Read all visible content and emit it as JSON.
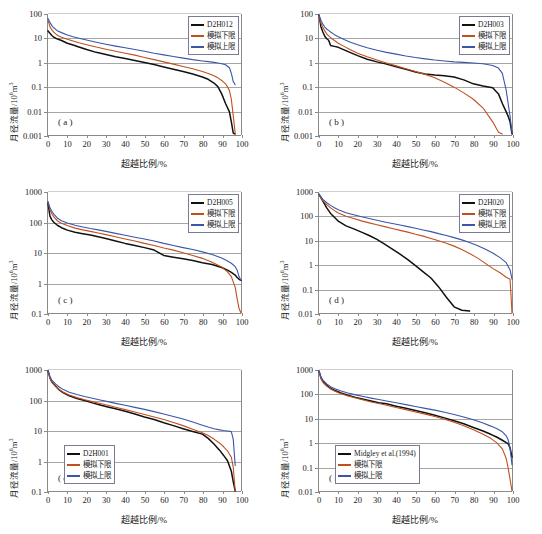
{
  "figure": {
    "axis_titles": {
      "y": "月径流量/10",
      "y_sup": "6",
      "y_tail": "m",
      "y_tail_sup": "3",
      "x": "超越比例/%"
    },
    "series_labels": {
      "lower": "模拟下限",
      "upper": "模拟上限"
    },
    "colors": {
      "observed": "#111111",
      "lower": "#c0501e",
      "upper": "#3a56a8",
      "grid": "#a6a6a6",
      "axis": "#8a8a8a"
    },
    "xticks": [
      "0",
      "10",
      "20",
      "30",
      "40",
      "50",
      "60",
      "70",
      "80",
      "90",
      "100"
    ]
  },
  "chart_data": [
    {
      "type": "line",
      "panel": "( a )",
      "title": "",
      "xlabel": "超越比例/%",
      "ylabel": "月径流量/10^6 m^3",
      "xlim": [
        0,
        100
      ],
      "ylim": [
        0.001,
        100
      ],
      "yscale": "log",
      "yticks": [
        "100",
        "10",
        "1",
        "0.1",
        "0.01",
        "0.001"
      ],
      "grid": true,
      "legend_position": "top-right",
      "legend": [
        "D2H012",
        "模拟下限",
        "模拟上限"
      ],
      "x": [
        0,
        1,
        2,
        3,
        4,
        5,
        7,
        10,
        13,
        16,
        20,
        25,
        30,
        35,
        40,
        45,
        50,
        55,
        60,
        65,
        70,
        75,
        80,
        83,
        86,
        88,
        90,
        92,
        94,
        95,
        96,
        97
      ],
      "series": [
        {
          "name": "D2H012",
          "color": "#111111",
          "values": [
            20,
            16,
            13,
            11,
            10,
            9.2,
            8,
            6.2,
            5.2,
            4.3,
            3.4,
            2.6,
            2.1,
            1.7,
            1.45,
            1.2,
            1.0,
            0.82,
            0.65,
            0.52,
            0.42,
            0.33,
            0.25,
            0.2,
            0.14,
            0.1,
            0.05,
            0.02,
            0.009,
            0.0035,
            0.0012,
            0.0011
          ]
        },
        {
          "name": "模拟下限",
          "color": "#c0501e",
          "values": [
            55,
            30,
            22,
            18,
            15,
            13,
            11,
            9.0,
            7.6,
            6.5,
            5.4,
            4.3,
            3.5,
            2.9,
            2.4,
            2.0,
            1.6,
            1.3,
            1.05,
            0.85,
            0.68,
            0.55,
            0.42,
            0.35,
            0.28,
            0.23,
            0.18,
            0.13,
            0.07,
            0.03,
            0.006,
            0.0012
          ]
        },
        {
          "name": "模拟上限",
          "color": "#3a56a8",
          "values": [
            65,
            45,
            33,
            27,
            23,
            20,
            17,
            13.5,
            11.5,
            10,
            8.4,
            6.8,
            5.6,
            4.7,
            4.0,
            3.4,
            2.9,
            2.4,
            2.05,
            1.75,
            1.5,
            1.3,
            1.15,
            1.08,
            1.0,
            0.95,
            0.88,
            0.8,
            0.6,
            0.35,
            0.16,
            0.12
          ]
        }
      ]
    },
    {
      "type": "line",
      "panel": "( b )",
      "xlabel": "超越比例/%",
      "ylabel": "月径流量/10^6 m^3",
      "xlim": [
        0,
        100
      ],
      "ylim": [
        0.001,
        100
      ],
      "yscale": "log",
      "yticks": [
        "100",
        "10",
        "1",
        "0.1",
        "0.01",
        "0.001"
      ],
      "grid": true,
      "legend_position": "top-right",
      "legend": [
        "D2H003",
        "模拟下限",
        "模拟上限"
      ],
      "x": [
        0,
        1,
        2,
        3,
        4,
        5,
        6,
        8,
        10,
        13,
        16,
        20,
        25,
        30,
        35,
        40,
        45,
        50,
        55,
        60,
        65,
        70,
        75,
        80,
        85,
        90,
        93,
        95,
        97,
        98,
        99,
        100
      ],
      "series": [
        {
          "name": "D2H003",
          "color": "#111111",
          "values": [
            90,
            30,
            18,
            12,
            9.5,
            8.2,
            5.0,
            4.6,
            4.2,
            3.3,
            2.6,
            1.9,
            1.35,
            1.05,
            0.85,
            0.66,
            0.52,
            0.4,
            0.33,
            0.3,
            0.28,
            0.25,
            0.19,
            0.13,
            0.105,
            0.09,
            0.05,
            0.02,
            0.009,
            0.006,
            0.0035,
            0.0011
          ]
        },
        {
          "name": "模拟下限",
          "color": "#c0501e",
          "values": [
            80,
            42,
            28,
            20,
            15,
            12.5,
            10.5,
            8.0,
            6.2,
            4.6,
            3.4,
            2.4,
            1.7,
            1.25,
            0.95,
            0.72,
            0.55,
            0.42,
            0.32,
            0.23,
            0.15,
            0.095,
            0.055,
            0.03,
            0.013,
            0.0035,
            0.0013,
            0.0011,
            null,
            null,
            null,
            null
          ]
        },
        {
          "name": "模拟上限",
          "color": "#3a56a8",
          "values": [
            92,
            55,
            38,
            29,
            24,
            21,
            18,
            14,
            11.5,
            8.8,
            7.0,
            5.4,
            4.0,
            3.2,
            2.6,
            2.2,
            1.85,
            1.6,
            1.4,
            1.25,
            1.15,
            1.05,
            1.0,
            0.95,
            0.88,
            0.75,
            0.58,
            0.35,
            0.07,
            0.02,
            0.006,
            0.0012
          ]
        }
      ]
    },
    {
      "type": "line",
      "panel": "( c )",
      "xlabel": "超越比例/%",
      "ylabel": "月径流量/10^6 m^3",
      "xlim": [
        0,
        100
      ],
      "ylim": [
        0.1,
        1000
      ],
      "yscale": "log",
      "yticks": [
        "1000",
        "100",
        "10",
        "1",
        "0.1"
      ],
      "grid": true,
      "legend_position": "top-right",
      "legend": [
        "D2H005",
        "模拟下限",
        "模拟上限"
      ],
      "x": [
        0,
        1,
        2,
        3,
        5,
        7,
        10,
        14,
        18,
        22,
        26,
        30,
        35,
        40,
        45,
        50,
        55,
        60,
        65,
        70,
        75,
        80,
        85,
        90,
        93,
        95,
        97,
        98,
        99,
        100
      ],
      "series": [
        {
          "name": "D2H005",
          "color": "#111111",
          "values": [
            430,
            160,
            120,
            100,
            78,
            66,
            55,
            47,
            42,
            38,
            33,
            29,
            24,
            20,
            17,
            14.5,
            12,
            8.0,
            7.0,
            6.2,
            5.4,
            4.6,
            4.0,
            3.2,
            2.6,
            2.2,
            1.8,
            1.5,
            1.3,
            1.2
          ]
        },
        {
          "name": "模拟下限",
          "color": "#c0501e",
          "values": [
            460,
            260,
            190,
            150,
            110,
            92,
            78,
            64,
            56,
            50,
            44,
            39,
            33,
            28,
            24,
            20,
            17,
            14,
            12,
            9.8,
            8.0,
            6.4,
            4.8,
            3.3,
            2.3,
            1.6,
            0.7,
            0.3,
            0.14,
            0.1
          ]
        },
        {
          "name": "模拟上限",
          "color": "#3a56a8",
          "values": [
            490,
            300,
            230,
            185,
            135,
            112,
            95,
            80,
            70,
            62,
            56,
            50,
            43,
            37,
            32,
            28,
            24,
            20,
            17,
            14.5,
            12.5,
            10.5,
            8.6,
            6.6,
            5.2,
            4.4,
            3.4,
            2.6,
            1.6,
            1.2
          ]
        }
      ]
    },
    {
      "type": "line",
      "panel": "( d )",
      "xlabel": "超越比例/%",
      "ylabel": "月径流量/10^6 m^3",
      "xlim": [
        0,
        100
      ],
      "ylim": [
        0.01,
        1000
      ],
      "yscale": "log",
      "yticks": [
        "1000",
        "100",
        "10",
        "1",
        "0.1",
        "0.01"
      ],
      "grid": true,
      "legend_position": "top-right",
      "legend": [
        "D2H020",
        "模拟下限",
        "模拟上限"
      ],
      "x": [
        0,
        2,
        4,
        6,
        8,
        10,
        14,
        18,
        22,
        26,
        30,
        34,
        38,
        42,
        46,
        50,
        54,
        58,
        62,
        66,
        70,
        74,
        78,
        82,
        86,
        90,
        94,
        97,
        99,
        100
      ],
      "series": [
        {
          "name": "D2H020",
          "color": "#111111",
          "values": [
            800,
            420,
            220,
            130,
            90,
            62,
            40,
            30,
            22,
            16,
            11,
            7.0,
            4.4,
            2.7,
            1.6,
            0.9,
            0.5,
            0.28,
            0.12,
            0.045,
            0.018,
            0.013,
            0.012,
            null,
            null,
            null,
            null,
            null,
            null,
            null
          ]
        },
        {
          "name": "模拟下限",
          "color": "#c0501e",
          "values": [
            780,
            440,
            300,
            220,
            170,
            135,
            100,
            80,
            64,
            53,
            44,
            37,
            31,
            26,
            22,
            18,
            15,
            12,
            9.6,
            7.6,
            5.8,
            4.2,
            2.9,
            1.9,
            1.15,
            0.7,
            0.45,
            0.3,
            0.25,
            0.01
          ]
        },
        {
          "name": "模拟上限",
          "color": "#3a56a8",
          "values": [
            820,
            500,
            360,
            280,
            225,
            185,
            140,
            115,
            95,
            80,
            68,
            58,
            50,
            43,
            37,
            32,
            27,
            23,
            19,
            16,
            13,
            10.5,
            8.2,
            6.2,
            4.4,
            3.0,
            1.9,
            1.2,
            0.6,
            0.25
          ]
        }
      ]
    },
    {
      "type": "line",
      "panel": "( e )",
      "xlabel": "超越比例/%",
      "ylabel": "月径流量/10^6 m^3",
      "xlim": [
        0,
        100
      ],
      "ylim": [
        0.1,
        1000
      ],
      "yscale": "log",
      "yticks": [
        "1000",
        "100",
        "10",
        "1",
        "0.1"
      ],
      "grid": true,
      "legend_position": "mid-left",
      "legend": [
        "D2H001",
        "模拟下限",
        "模拟上限"
      ],
      "x": [
        0,
        1,
        2,
        4,
        6,
        8,
        11,
        15,
        19,
        23,
        27,
        31,
        35,
        40,
        45,
        50,
        55,
        60,
        65,
        70,
        75,
        80,
        83,
        86,
        89,
        91,
        93,
        95,
        96,
        97
      ],
      "series": [
        {
          "name": "D2H001",
          "color": "#111111",
          "values": [
            950,
            560,
            400,
            290,
            215,
            175,
            140,
            115,
            98,
            82,
            70,
            60,
            52,
            43,
            35,
            28,
            23,
            18,
            14.5,
            11.5,
            9.2,
            7.6,
            5.5,
            3.6,
            2.2,
            1.5,
            1.0,
            0.45,
            0.2,
            0.1
          ]
        },
        {
          "name": "模拟下限",
          "color": "#c0501e",
          "values": [
            960,
            520,
            390,
            280,
            220,
            185,
            150,
            122,
            104,
            90,
            78,
            68,
            59,
            49,
            41,
            34,
            28,
            23,
            18.5,
            14.5,
            11.0,
            8.4,
            6.8,
            5.2,
            3.8,
            2.9,
            2.1,
            1.3,
            0.6,
            0.1
          ]
        },
        {
          "name": "模拟上限",
          "color": "#3a56a8",
          "values": [
            980,
            600,
            460,
            340,
            270,
            225,
            185,
            155,
            133,
            116,
            102,
            90,
            79,
            68,
            58,
            50,
            42,
            35,
            29,
            24,
            19,
            15,
            13,
            11.5,
            10.5,
            10.0,
            9.6,
            9.2,
            5.0,
            0.7
          ]
        }
      ]
    },
    {
      "type": "line",
      "panel": "( f )",
      "xlabel": "超越比例/%",
      "ylabel": "月径流量/10^6 m^3",
      "xlim": [
        0,
        100
      ],
      "ylim": [
        0.01,
        1000
      ],
      "yscale": "log",
      "yticks": [
        "1000",
        "100",
        "10",
        "1",
        "0.1",
        "0.01"
      ],
      "grid": true,
      "legend_position": "mid-left",
      "legend": [
        "Midgley et al.(1994)",
        "模拟下限",
        "模拟上限"
      ],
      "x": [
        0,
        1,
        2,
        4,
        6,
        8,
        11,
        15,
        19,
        23,
        27,
        31,
        35,
        40,
        45,
        50,
        55,
        60,
        65,
        70,
        75,
        80,
        85,
        89,
        92,
        95,
        97,
        98,
        99,
        100
      ],
      "series": [
        {
          "name": "Midgley et al.(1994)",
          "color": "#111111",
          "values": [
            900,
            480,
            340,
            230,
            175,
            145,
            115,
            90,
            74,
            62,
            52,
            44,
            40,
            32,
            26,
            21,
            17,
            13.5,
            10.5,
            8.0,
            6.0,
            4.2,
            3.0,
            2.2,
            1.7,
            1.25,
            1.0,
            0.9,
            0.6,
            0.25
          ]
        },
        {
          "name": "模拟下限",
          "color": "#c0501e",
          "values": [
            880,
            440,
            310,
            215,
            165,
            135,
            108,
            85,
            70,
            58,
            48,
            41,
            35,
            28,
            23,
            18.5,
            15,
            12,
            9.2,
            7.0,
            5.0,
            3.4,
            2.2,
            1.5,
            1.0,
            0.55,
            0.22,
            0.09,
            0.03,
            0.01
          ]
        },
        {
          "name": "模拟上限",
          "color": "#3a56a8",
          "values": [
            920,
            520,
            380,
            265,
            205,
            172,
            140,
            112,
            94,
            80,
            69,
            60,
            52,
            44,
            37,
            31,
            26,
            22,
            18,
            14.5,
            11.5,
            8.8,
            6.4,
            4.8,
            3.8,
            2.8,
            1.9,
            1.3,
            0.6,
            0.12
          ]
        }
      ]
    }
  ]
}
